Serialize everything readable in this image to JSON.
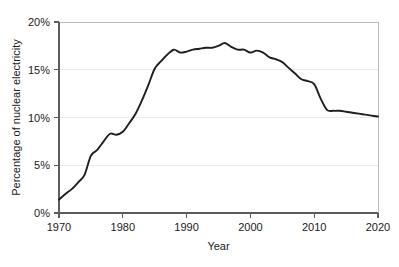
{
  "chart_data": {
    "type": "line",
    "title": "",
    "subtitle": "",
    "xlabel": "Year",
    "ylabel": "Percentage of nuclear electricity",
    "xlim": [
      1970,
      2020
    ],
    "ylim": [
      0,
      20
    ],
    "grid": "horizontal",
    "legend": "none",
    "line_color": "#1f1f1f",
    "grid_color": "#eceaea",
    "axis_color": "#5c5c5c",
    "background_color": "#ffffff",
    "x_ticks": [
      1970,
      1980,
      1990,
      2000,
      2010,
      2020
    ],
    "x_tick_labels": [
      "1970",
      "1980",
      "1990",
      "2000",
      "2010",
      "2020"
    ],
    "y_ticks": [
      0,
      5,
      10,
      15,
      20
    ],
    "y_tick_labels": [
      "0%",
      "5%",
      "10%",
      "15%",
      "20%"
    ],
    "series": [
      {
        "name": "Percentage of nuclear electricity",
        "x": [
          1970,
          1971,
          1972,
          1973,
          1974,
          1975,
          1976,
          1977,
          1978,
          1979,
          1980,
          1981,
          1982,
          1983,
          1984,
          1985,
          1986,
          1987,
          1988,
          1989,
          1990,
          1991,
          1992,
          1993,
          1994,
          1995,
          1996,
          1997,
          1998,
          1999,
          2000,
          2001,
          2002,
          2003,
          2004,
          2005,
          2006,
          2007,
          2008,
          2009,
          2010,
          2011,
          2012,
          2013,
          2014,
          2015,
          2016,
          2017,
          2018,
          2019,
          2020
        ],
        "values": [
          1.4,
          2.0,
          2.5,
          3.2,
          4.0,
          6.0,
          6.6,
          7.5,
          8.3,
          8.2,
          8.5,
          9.4,
          10.4,
          11.8,
          13.4,
          15.1,
          15.9,
          16.6,
          17.1,
          16.8,
          16.9,
          17.1,
          17.2,
          17.3,
          17.3,
          17.5,
          17.8,
          17.4,
          17.1,
          17.1,
          16.8,
          17.0,
          16.8,
          16.3,
          16.1,
          15.8,
          15.2,
          14.6,
          14.0,
          13.8,
          13.5,
          12.0,
          10.8,
          10.7,
          10.7,
          10.6,
          10.5,
          10.4,
          10.3,
          10.2,
          10.1
        ],
        "color": "#1f1f1f"
      }
    ],
    "notes": {
      "start_value": "1.4% in 1970",
      "peak_value": "17.8% around 1996",
      "post_2011_drop": "falls from about 13.5% in 2010 to about 10.8% in 2012",
      "end_value": "10.1% in 2020"
    }
  }
}
